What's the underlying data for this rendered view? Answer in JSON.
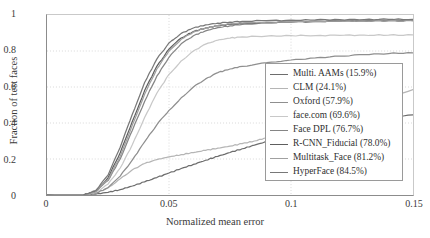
{
  "chart_data": {
    "type": "line",
    "title": "",
    "xlabel": "Normalized mean error",
    "ylabel": "Fraction of test faces",
    "xlim": [
      0,
      0.15
    ],
    "ylim": [
      0,
      1
    ],
    "xticks": [
      "0",
      "0.05",
      "0.1",
      "0.15"
    ],
    "xtick_values": [
      0,
      0.05,
      0.1,
      0.15
    ],
    "yticks": [
      "0",
      "0.2",
      "0.4",
      "0.6",
      "0.8",
      "1"
    ],
    "ytick_values": [
      0,
      0.2,
      0.4,
      0.6,
      0.8,
      1
    ],
    "grid": true,
    "legend_position": "lower right",
    "series": [
      {
        "name": "Multi. AAMs (15.9%)",
        "label": "Multi. AAMs (15.9%)",
        "auc_percent": 15.9,
        "color": "#6d6d6d",
        "x": [
          0.0,
          0.015,
          0.02,
          0.025,
          0.03,
          0.035,
          0.04,
          0.045,
          0.05,
          0.055,
          0.06,
          0.065,
          0.07,
          0.075,
          0.08,
          0.085,
          0.09,
          0.095,
          0.1,
          0.11,
          0.12,
          0.13,
          0.14,
          0.15
        ],
        "y": [
          0.0,
          0.0,
          0.005,
          0.015,
          0.03,
          0.05,
          0.073,
          0.097,
          0.122,
          0.147,
          0.17,
          0.193,
          0.215,
          0.236,
          0.257,
          0.277,
          0.296,
          0.312,
          0.327,
          0.355,
          0.38,
          0.403,
          0.425,
          0.445
        ]
      },
      {
        "name": "CLM (24.1%)",
        "label": "CLM (24.1%)",
        "auc_percent": 24.1,
        "color": "#b5b5b5",
        "x": [
          0.0,
          0.015,
          0.02,
          0.025,
          0.03,
          0.035,
          0.04,
          0.045,
          0.05,
          0.055,
          0.06,
          0.065,
          0.07,
          0.075,
          0.08,
          0.085,
          0.09,
          0.095,
          0.1,
          0.11,
          0.12,
          0.13,
          0.14,
          0.15
        ],
        "y": [
          0.0,
          0.0,
          0.01,
          0.04,
          0.09,
          0.14,
          0.175,
          0.197,
          0.212,
          0.224,
          0.236,
          0.248,
          0.26,
          0.272,
          0.285,
          0.3,
          0.317,
          0.33,
          0.344,
          0.38,
          0.43,
          0.49,
          0.545,
          0.585
        ]
      },
      {
        "name": "Oxford (57.9%)",
        "label": "Oxford (57.9%)",
        "auc_percent": 57.9,
        "color": "#8f8f8f",
        "x": [
          0.0,
          0.015,
          0.02,
          0.025,
          0.03,
          0.035,
          0.04,
          0.045,
          0.05,
          0.055,
          0.06,
          0.065,
          0.07,
          0.075,
          0.08,
          0.09,
          0.1,
          0.11,
          0.12,
          0.13,
          0.14,
          0.15
        ],
        "y": [
          0.0,
          0.0,
          0.01,
          0.04,
          0.105,
          0.195,
          0.295,
          0.39,
          0.47,
          0.54,
          0.6,
          0.645,
          0.68,
          0.7,
          0.715,
          0.735,
          0.75,
          0.762,
          0.772,
          0.78,
          0.786,
          0.79
        ]
      },
      {
        "name": "face.com (69.6%)",
        "label": "face.com (69.6%)",
        "auc_percent": 69.6,
        "color": "#c8c8c8",
        "x": [
          0.0,
          0.015,
          0.02,
          0.025,
          0.03,
          0.035,
          0.04,
          0.045,
          0.05,
          0.055,
          0.06,
          0.065,
          0.07,
          0.075,
          0.08,
          0.09,
          0.1,
          0.11,
          0.12,
          0.13,
          0.14,
          0.15
        ],
        "y": [
          0.0,
          0.0,
          0.015,
          0.06,
          0.15,
          0.28,
          0.43,
          0.565,
          0.67,
          0.745,
          0.8,
          0.838,
          0.86,
          0.872,
          0.878,
          0.883,
          0.885,
          0.886,
          0.887,
          0.888,
          0.888,
          0.889
        ]
      },
      {
        "name": "Face DPL (76.7%)",
        "label": "Face DPL (76.7%)",
        "auc_percent": 76.7,
        "color": "#858585",
        "x": [
          0.0,
          0.015,
          0.02,
          0.025,
          0.03,
          0.035,
          0.04,
          0.045,
          0.05,
          0.055,
          0.06,
          0.065,
          0.07,
          0.075,
          0.08,
          0.09,
          0.1,
          0.11,
          0.12,
          0.13,
          0.14,
          0.15
        ],
        "y": [
          0.0,
          0.0,
          0.02,
          0.08,
          0.2,
          0.36,
          0.52,
          0.66,
          0.765,
          0.84,
          0.885,
          0.912,
          0.93,
          0.94,
          0.948,
          0.957,
          0.962,
          0.966,
          0.968,
          0.97,
          0.971,
          0.972
        ]
      },
      {
        "name": "R-CNN_Fiducial (78.0%)",
        "label": "R-CNN_Fiducial (78.0%)",
        "auc_percent": 78.0,
        "color": "#5e5e5e",
        "x": [
          0.0,
          0.015,
          0.02,
          0.025,
          0.03,
          0.035,
          0.04,
          0.045,
          0.05,
          0.055,
          0.06,
          0.065,
          0.07,
          0.075,
          0.08,
          0.09,
          0.1,
          0.11,
          0.12,
          0.13,
          0.14,
          0.15
        ],
        "y": [
          0.0,
          0.0,
          0.022,
          0.095,
          0.235,
          0.41,
          0.58,
          0.715,
          0.81,
          0.872,
          0.908,
          0.928,
          0.94,
          0.948,
          0.953,
          0.958,
          0.962,
          0.964,
          0.966,
          0.967,
          0.968,
          0.969
        ]
      },
      {
        "name": "Multitask_Face (81.2%)",
        "label": "Multitask_Face (81.2%)",
        "auc_percent": 81.2,
        "color": "#a0a0a0",
        "x": [
          0.0,
          0.015,
          0.02,
          0.025,
          0.03,
          0.035,
          0.04,
          0.045,
          0.05,
          0.055,
          0.06,
          0.065,
          0.07,
          0.075,
          0.08,
          0.09,
          0.1,
          0.11,
          0.12,
          0.13,
          0.14,
          0.15
        ],
        "y": [
          0.0,
          0.0,
          0.018,
          0.085,
          0.215,
          0.39,
          0.56,
          0.7,
          0.8,
          0.865,
          0.905,
          0.928,
          0.942,
          0.95,
          0.955,
          0.96,
          0.963,
          0.965,
          0.966,
          0.967,
          0.968,
          0.968
        ]
      },
      {
        "name": "HyperFace (84.5%)",
        "label": "HyperFace (84.5%)",
        "auc_percent": 84.5,
        "color": "#787878",
        "x": [
          0.0,
          0.015,
          0.02,
          0.025,
          0.03,
          0.035,
          0.04,
          0.045,
          0.05,
          0.055,
          0.06,
          0.065,
          0.07,
          0.075,
          0.08,
          0.09,
          0.1,
          0.11,
          0.12,
          0.13,
          0.14,
          0.15
        ],
        "y": [
          0.0,
          0.0,
          0.025,
          0.11,
          0.265,
          0.45,
          0.625,
          0.755,
          0.845,
          0.898,
          0.928,
          0.945,
          0.955,
          0.961,
          0.965,
          0.969,
          0.971,
          0.973,
          0.974,
          0.975,
          0.976,
          0.976
        ]
      }
    ]
  }
}
